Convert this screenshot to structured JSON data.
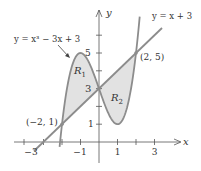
{
  "figure": {
    "type": "area between curves",
    "axes": {
      "x_label": "x",
      "y_label": "y",
      "x_tick_labels": [
        "−3",
        "−1",
        "1",
        "3"
      ],
      "y_tick_labels": [
        "1",
        "3",
        "5"
      ]
    },
    "curves": [
      {
        "name": "cubic",
        "label": "y = x³ − 3x + 3"
      },
      {
        "name": "line",
        "label": "y = x + 3"
      }
    ],
    "regions": [
      {
        "name": "R1",
        "label_main": "R",
        "label_sub": "1"
      },
      {
        "name": "R2",
        "label_main": "R",
        "label_sub": "2"
      }
    ],
    "points": [
      {
        "label": "(−2, 1)",
        "x": -2,
        "y": 1
      },
      {
        "label": "(2, 5)",
        "x": 2,
        "y": 5
      },
      {
        "label": "3",
        "x": 0,
        "y": 3
      }
    ],
    "colors": {
      "curve": "#8c8c8c",
      "shade": "#e2e2e2",
      "axis": "#555555",
      "text": "#333333"
    }
  }
}
